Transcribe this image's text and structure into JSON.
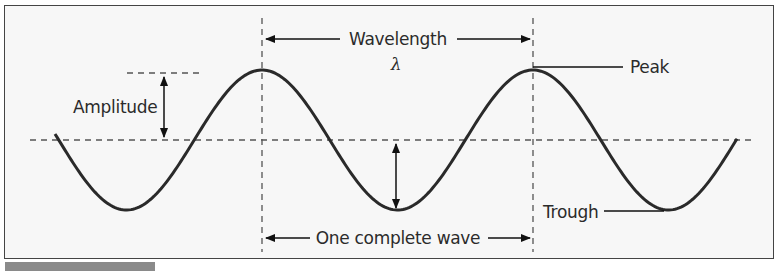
{
  "labels": {
    "amplitude": "Amplitude",
    "wavelength": "Wavelength",
    "lambda": "λ",
    "peak": "Peak",
    "trough": "Trough",
    "complete_wave": "One complete wave"
  },
  "colors": {
    "curve": "#2a2a2a",
    "dash": "#555555",
    "background": "#f7f7f7",
    "border": "#444444"
  }
}
